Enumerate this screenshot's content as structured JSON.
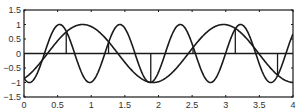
{
  "chart_data": {
    "type": "line",
    "title": "",
    "xlabel": "",
    "ylabel": "",
    "xlim": [
      0,
      4
    ],
    "ylim": [
      -1.5,
      1.5
    ],
    "grid": false,
    "legend": null,
    "x_ticks": [
      "0",
      "0.5",
      "1",
      "1.5",
      "2",
      "2.5",
      "3",
      "3.5",
      "4"
    ],
    "y_ticks": [
      "-1.5",
      "-1",
      "-0.5",
      "0",
      "0.5",
      "1",
      "1.5"
    ],
    "series": [
      {
        "name": "slow sinusoid",
        "kind": "line",
        "formula": "sin(3x - pi/3)",
        "x": [
          0,
          0.25,
          0.5,
          0.75,
          1.0,
          1.25,
          1.5,
          1.75,
          2.0,
          2.25,
          2.5,
          2.75,
          3.0,
          3.25,
          3.5,
          3.75,
          4.0
        ],
        "values": [
          -0.87,
          -0.09,
          0.71,
          0.99,
          0.61,
          -0.2,
          -0.85,
          -0.95,
          -0.42,
          0.48,
          0.98,
          0.84,
          0.1,
          -0.72,
          -0.99,
          -0.58,
          0.26
        ]
      },
      {
        "name": "fast sinusoid",
        "kind": "line",
        "formula": "sin(7x - 2.13)",
        "x": [
          0,
          0.25,
          0.5,
          0.75,
          1.0,
          1.25,
          1.5,
          1.75,
          2.0,
          2.25,
          2.5,
          2.75,
          3.0,
          3.25,
          3.5,
          3.75,
          4.0
        ],
        "values": [
          -0.85,
          -0.38,
          1.0,
          0.15,
          -0.99,
          0.34,
          0.98,
          -0.84,
          -0.62,
          0.98,
          -0.12,
          -0.99,
          0.55,
          0.63,
          -0.97,
          0.44,
          0.72
        ]
      },
      {
        "name": "samples",
        "kind": "stem",
        "x": [
          0,
          0.628,
          1.257,
          1.885,
          2.513,
          3.142,
          3.77
        ],
        "values": [
          -0.87,
          0.74,
          0.41,
          -0.99,
          0.21,
          0.87,
          -0.74
        ]
      }
    ],
    "baseline": 0
  }
}
